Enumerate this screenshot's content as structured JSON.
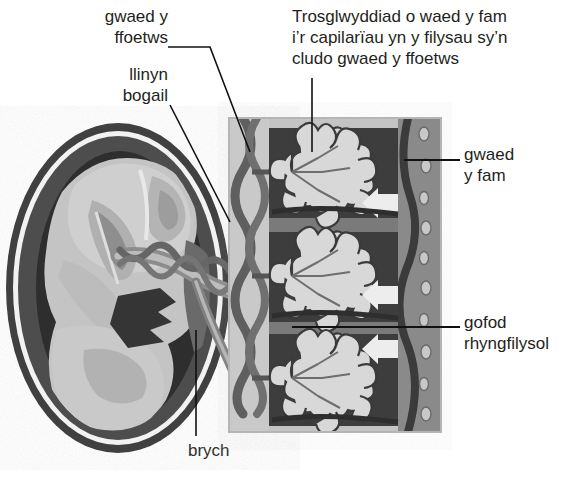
{
  "diagram": {
    "title_note": "Trosglwyddiad o waed y fam\ni’r capilarïau yn y filysau sy’n\ncludo gwaed y ffoetws",
    "labels": {
      "fetal_blood": "gwaed y\nffoetws",
      "umbilical_cord": "llinyn\nbogail",
      "placenta": "brych",
      "maternal_blood": "gwaed\ny fam",
      "intervillous_space": "gofod\nrhyngfilysol"
    },
    "colors": {
      "background": "#ffffff",
      "text": "#231f20",
      "leader_line": "#111111",
      "panel_frame": "#b9b9b9",
      "panel_light": "#c9c9c9",
      "panel_mid": "#8f8f8f",
      "panel_dark": "#4f4f4f",
      "panel_darkest": "#3a3a3a",
      "villi_light": "#d6d6d6",
      "uterus_wall": "#4a4a4a",
      "uterus_white": "#f4f4f4",
      "fetus_body": "#c6c6c6",
      "fetus_shadow": "#9d9d9d",
      "cord_dark": "#6e6e6e",
      "cord_mid": "#8b8b8b",
      "arrow_white": "#eeeeee"
    },
    "panel": {
      "name": "placenta-cross-section",
      "x": 229,
      "y": 118,
      "width": 212,
      "height": 314,
      "villi_count": 3,
      "maternal_arrows": 3,
      "arrow_direction": "left"
    },
    "fetus_panel": {
      "name": "fetus-in-uterus",
      "cx": 118,
      "cy": 288,
      "rx": 112,
      "ry": 165
    }
  }
}
